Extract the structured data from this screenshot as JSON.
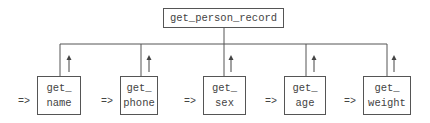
{
  "diagram": {
    "root": {
      "label": "get_person_record"
    },
    "children": [
      {
        "line1": "get_",
        "line2": "name",
        "prefix": "=>"
      },
      {
        "line1": "get_",
        "line2": "phone",
        "prefix": "=>"
      },
      {
        "line1": "get_",
        "line2": "sex",
        "prefix": "=>"
      },
      {
        "line1": "get_",
        "line2": "age",
        "prefix": "=>"
      },
      {
        "line1": "get_",
        "line2": "weight",
        "prefix": "=>"
      }
    ],
    "colors": {
      "line": "#555555",
      "text": "#444444",
      "background": "#ffffff"
    }
  }
}
